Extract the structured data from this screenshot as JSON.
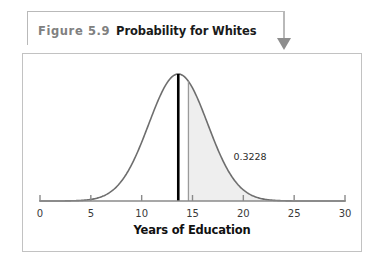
{
  "caption": {
    "figure_number": "Figure 5.9",
    "title": "Probability for Whites",
    "arrow_icon": "down-triangle-arrow-icon"
  },
  "colors": {
    "curve": "#6e6e6e",
    "shaded_area": "#eeeeee",
    "mean_line": "#000000",
    "cut_line": "#9a9a9a",
    "axis": "#8a8a8a",
    "frame": "#c2c2c2",
    "callout": "#b9b9b9",
    "caption_number": "#808080",
    "caption_title": "#1a1a1a"
  },
  "chart_data": {
    "type": "area",
    "title": "Probability for Whites",
    "xlabel": "Years of Education",
    "ylabel": "",
    "xlim": [
      0,
      30
    ],
    "ylim": [
      0,
      1
    ],
    "grid": false,
    "legend": null,
    "distribution": {
      "shape": "normal",
      "mean": 13.6,
      "std_dev": 2.9,
      "peak_x": 13.6
    },
    "xticks": [
      0,
      5,
      10,
      15,
      20,
      25,
      30
    ],
    "xtick_labels": [
      "0",
      "5",
      "10",
      "15",
      "20",
      "25",
      "30"
    ],
    "markers": [
      {
        "name": "mean-line",
        "x": 13.6,
        "style": "thick-solid-black",
        "label": ""
      },
      {
        "name": "cutoff-line",
        "x": 14.6,
        "style": "thin-solid-gray",
        "label": ""
      }
    ],
    "shaded_region": {
      "from_x": 14.6,
      "to_x": 30,
      "probability": 0.3228,
      "annotation": "0.3228",
      "annotation_x": 20.6,
      "fill": "#eeeeee"
    }
  }
}
